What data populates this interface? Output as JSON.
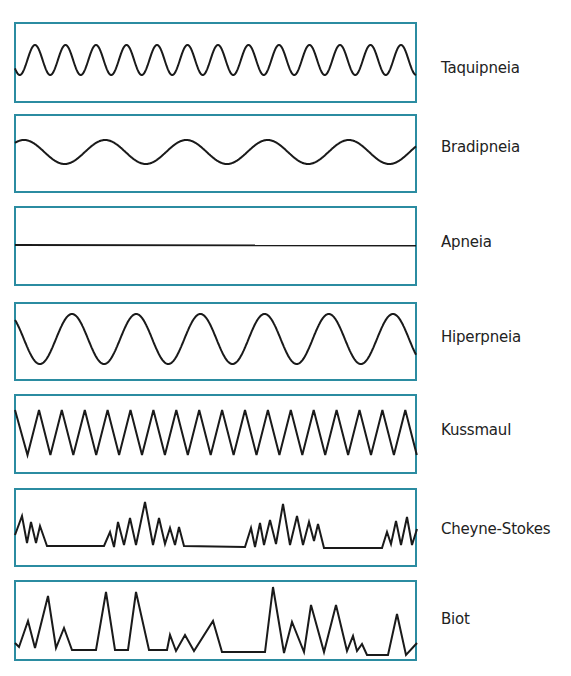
{
  "diagram": {
    "title": "",
    "colors": {
      "border": "#2b8ca1",
      "line": "#1a1a1a",
      "text": "#222222"
    },
    "patterns": [
      {
        "id": "taquipneia",
        "label": "Taquipneia",
        "type": "sine",
        "description": "fast regular shallow waves"
      },
      {
        "id": "bradipneia",
        "label": "Bradipneia",
        "type": "sine",
        "description": "slow regular waves"
      },
      {
        "id": "apneia",
        "label": "Apneia",
        "type": "flat",
        "description": "flat line, no breathing"
      },
      {
        "id": "hiperpneia",
        "label": "Hiperpneia",
        "type": "sine",
        "description": "deep regular waves"
      },
      {
        "id": "kussmaul",
        "label": "Kussmaul",
        "type": "zigzag",
        "description": "deep fast sharp zigzag"
      },
      {
        "id": "cheyne-stokes",
        "label": "Cheyne-Stokes",
        "type": "crescendo-apnea",
        "description": "clusters increasing/decreasing amplitude separated by apnea"
      },
      {
        "id": "biot",
        "label": "Biot",
        "type": "irregular",
        "description": "irregular peaks with apnea periods"
      }
    ]
  }
}
